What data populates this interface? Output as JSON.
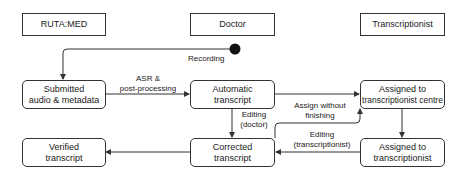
{
  "lanes": [
    {
      "id": "ruta-med",
      "label": "RUTA:MED"
    },
    {
      "id": "doctor",
      "label": "Doctor"
    },
    {
      "id": "transcriptionist",
      "label": "Transcriptionist"
    }
  ],
  "states": {
    "submitted": {
      "line1": "Submitted",
      "line2": "audio & metadata"
    },
    "automatic": {
      "line1": "Automatic",
      "line2": "transcript"
    },
    "assigned_centre": {
      "line1": "Assigned to",
      "line2": "transcriptionist centre"
    },
    "verified": {
      "line1": "Verified",
      "line2": "transcript"
    },
    "corrected": {
      "line1": "Corrected",
      "line2": "transcript"
    },
    "assigned_transcriptionist": {
      "line1": "Assigned to",
      "line2": "transcriptionist"
    }
  },
  "transitions": {
    "recording": {
      "label": "Recording"
    },
    "asr": {
      "line1": "ASR &",
      "line2": "post-processing"
    },
    "editing_doctor": {
      "line1": "Editing",
      "line2": "(doctor)"
    },
    "assign_without_finishing": {
      "line1": "Assign without",
      "line2": "finishing"
    },
    "editing_transcriptionist": {
      "line1": "Editing",
      "line2": "(transcriptionist)"
    }
  },
  "colors": {
    "stroke": "#333333",
    "start_node": "#111111",
    "background": "#ffffff"
  }
}
